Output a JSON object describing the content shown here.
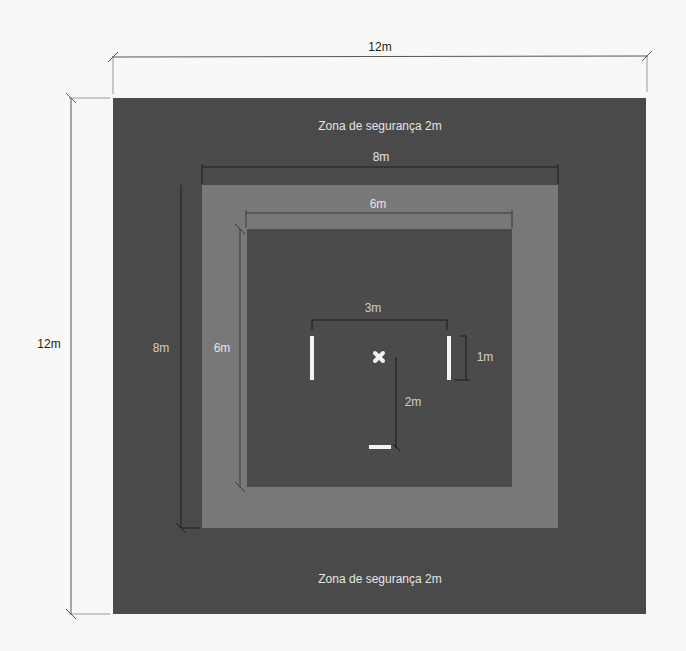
{
  "diagram": {
    "units": "m",
    "outer_square": {
      "size": "12m",
      "color": "#4a4a4a",
      "top_label": "Zona de segurança 2m",
      "bottom_label": "Zona de segurança 2m"
    },
    "middle_square": {
      "size": "8m",
      "color": "#787878"
    },
    "inner_square": {
      "size": "6m",
      "color": "#4b4b4b"
    },
    "dimensions": {
      "outer_width": "12m",
      "outer_height": "12m",
      "middle_width": "8m",
      "middle_height": "8m",
      "inner_width": "6m",
      "inner_height": "6m",
      "marker_spacing": "3m",
      "marker_length": "1m",
      "center_to_bottom": "2m"
    },
    "markers": [
      {
        "name": "left-bar",
        "orientation": "vertical"
      },
      {
        "name": "right-bar",
        "orientation": "vertical"
      },
      {
        "name": "center-mark",
        "shape": "x"
      },
      {
        "name": "bottom-bar",
        "orientation": "horizontal"
      }
    ]
  }
}
